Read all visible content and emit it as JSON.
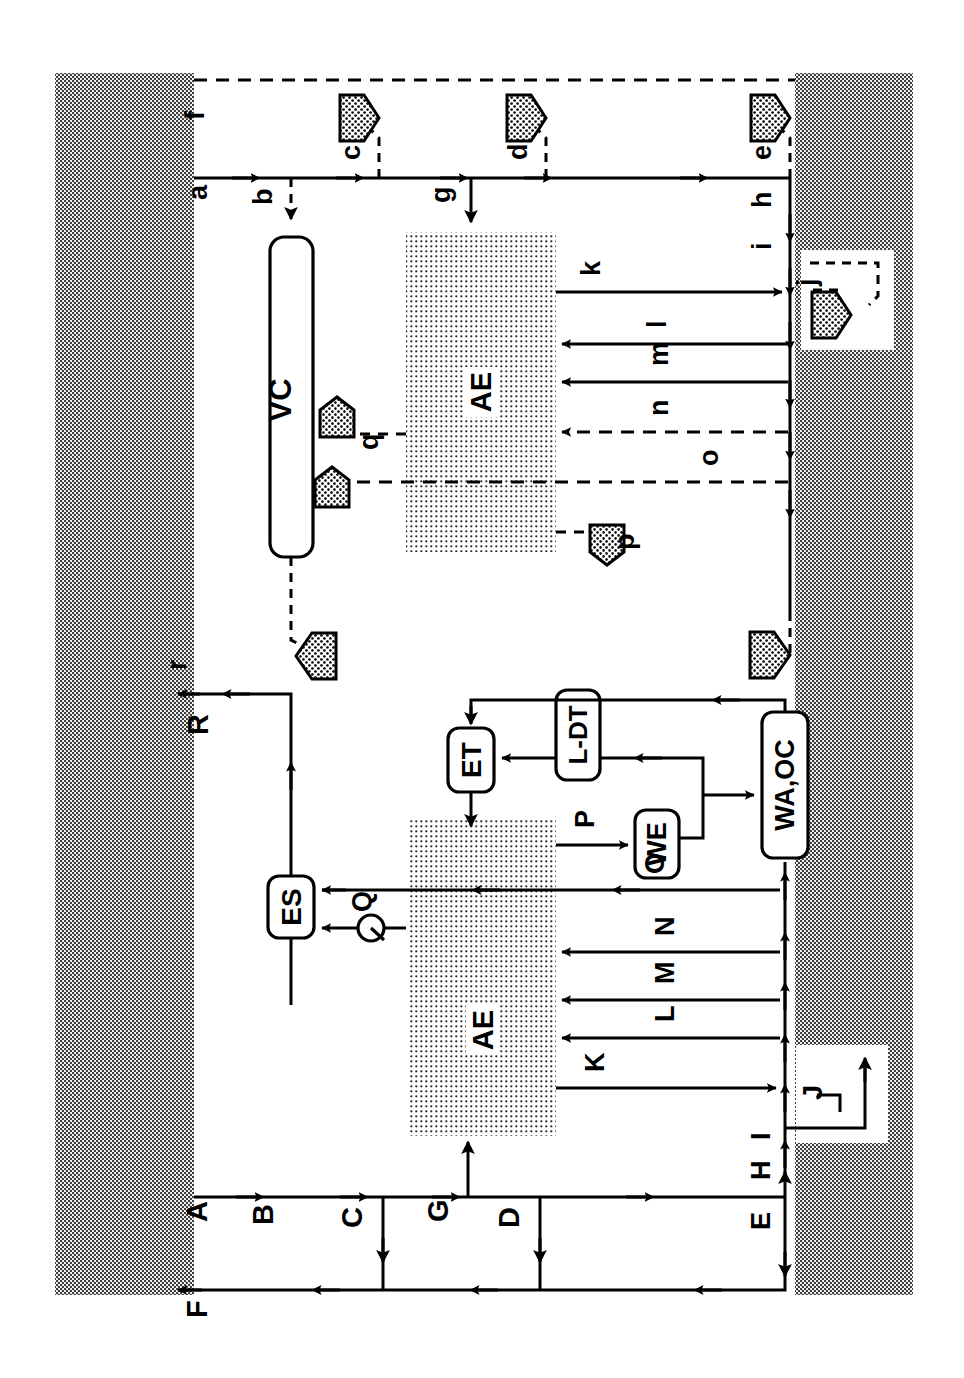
{
  "diagram": {
    "orientation_deg": -90,
    "canvas": {
      "width": 964,
      "height": 1378,
      "background": "#ffffff"
    },
    "colors": {
      "line": "#000000",
      "border_band": "#b3b3b3",
      "zone_fill": "#d9d9d9",
      "marker_fill": "#9e9e9e",
      "white": "#ffffff"
    },
    "zones": [
      {
        "name": "zone-ae-upper",
        "label": "AE"
      },
      {
        "name": "zone-ae-lower",
        "label": "AE"
      }
    ],
    "blocks": [
      {
        "name": "block-vc",
        "label": "VC"
      },
      {
        "name": "block-es",
        "label": "ES"
      },
      {
        "name": "block-et",
        "label": "ET"
      },
      {
        "name": "block-ldt",
        "label": "L-DT"
      },
      {
        "name": "block-we",
        "label": "WE"
      },
      {
        "name": "block-waoc",
        "label": "WA,OC"
      }
    ],
    "upper_flow_labels": [
      {
        "name": "flow-label-a",
        "label": "a"
      },
      {
        "name": "flow-label-b",
        "label": "b"
      },
      {
        "name": "flow-label-c",
        "label": "c"
      },
      {
        "name": "flow-label-d",
        "label": "d"
      },
      {
        "name": "flow-label-e",
        "label": "e"
      },
      {
        "name": "flow-label-f",
        "label": "f"
      },
      {
        "name": "flow-label-g",
        "label": "g"
      },
      {
        "name": "flow-label-h",
        "label": "h"
      },
      {
        "name": "flow-label-i",
        "label": "i"
      },
      {
        "name": "flow-label-j",
        "label": "j"
      },
      {
        "name": "flow-label-k",
        "label": "k"
      },
      {
        "name": "flow-label-l",
        "label": "l"
      },
      {
        "name": "flow-label-m",
        "label": "m"
      },
      {
        "name": "flow-label-n",
        "label": "n"
      },
      {
        "name": "flow-label-o",
        "label": "o"
      },
      {
        "name": "flow-label-p",
        "label": "p"
      },
      {
        "name": "flow-label-q",
        "label": "q"
      },
      {
        "name": "flow-label-r",
        "label": "r"
      }
    ],
    "lower_flow_labels": [
      {
        "name": "flow-label-A",
        "label": "A"
      },
      {
        "name": "flow-label-B",
        "label": "B"
      },
      {
        "name": "flow-label-C",
        "label": "C"
      },
      {
        "name": "flow-label-D",
        "label": "D"
      },
      {
        "name": "flow-label-E",
        "label": "E"
      },
      {
        "name": "flow-label-F",
        "label": "F"
      },
      {
        "name": "flow-label-G",
        "label": "G"
      },
      {
        "name": "flow-label-H",
        "label": "H"
      },
      {
        "name": "flow-label-I",
        "label": "I"
      },
      {
        "name": "flow-label-J",
        "label": "J"
      },
      {
        "name": "flow-label-K",
        "label": "K"
      },
      {
        "name": "flow-label-L",
        "label": "L"
      },
      {
        "name": "flow-label-M",
        "label": "M"
      },
      {
        "name": "flow-label-N",
        "label": "N"
      },
      {
        "name": "flow-label-O",
        "label": "O"
      },
      {
        "name": "flow-label-P",
        "label": "P"
      },
      {
        "name": "flow-label-Q",
        "label": "Q"
      },
      {
        "name": "flow-label-R",
        "label": "R"
      }
    ],
    "markers": [
      {
        "name": "pentagon-marker-c",
        "shape": "pentagon-right"
      },
      {
        "name": "pentagon-marker-d",
        "shape": "pentagon-right"
      },
      {
        "name": "pentagon-marker-e",
        "shape": "pentagon-right"
      },
      {
        "name": "pentagon-marker-j",
        "shape": "pentagon-right"
      },
      {
        "name": "pentagon-marker-p",
        "shape": "pentagon-up"
      },
      {
        "name": "pentagon-marker-q",
        "shape": "pentagon-down"
      },
      {
        "name": "pentagon-marker-o",
        "shape": "pentagon-up"
      },
      {
        "name": "pentagon-marker-r",
        "shape": "pentagon-left"
      },
      {
        "name": "pentagon-marker-bottom",
        "shape": "pentagon-right"
      }
    ]
  }
}
